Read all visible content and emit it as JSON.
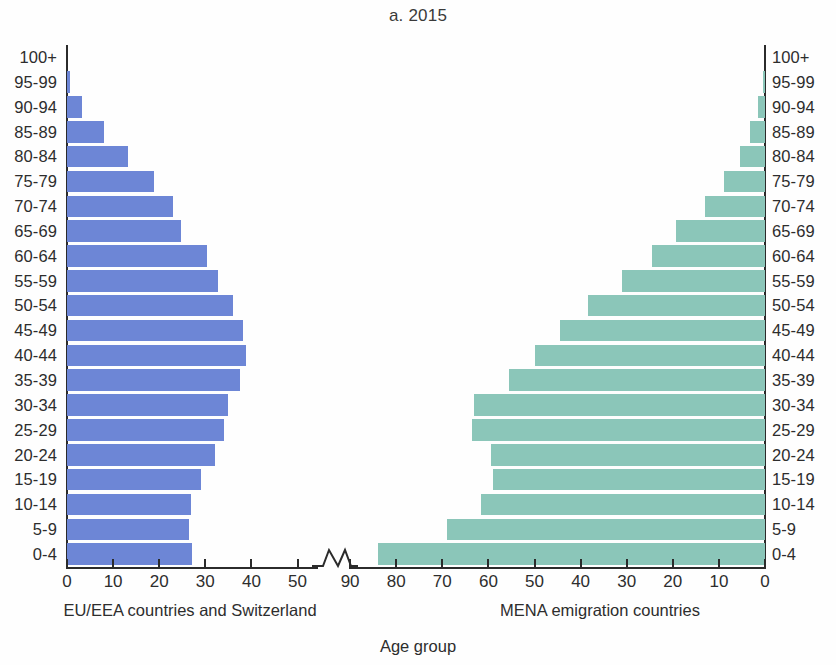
{
  "chart_data": {
    "type": "bar",
    "subtype": "population-pyramid",
    "title": "a. 2015",
    "xlabel": "Age group",
    "ylabel": "",
    "grid": false,
    "legend_position": "none",
    "categories": [
      "100+",
      "95-99",
      "90-94",
      "85-89",
      "80-84",
      "75-79",
      "70-74",
      "65-69",
      "60-64",
      "55-59",
      "50-54",
      "45-49",
      "40-44",
      "35-39",
      "30-34",
      "25-29",
      "20-24",
      "15-19",
      "10-14",
      "5-9",
      "0-4"
    ],
    "series": [
      {
        "name": "EU/EEA countries and Switzerland",
        "side": "left",
        "color": "#6d86d6",
        "axis_ticks": [
          0,
          10,
          20,
          30,
          40,
          50
        ],
        "axis_max": 50,
        "xlim": [
          0,
          50
        ],
        "values": [
          0,
          0.6,
          3.2,
          8.0,
          13.2,
          18.8,
          22.9,
          24.8,
          30.3,
          32.8,
          36.0,
          38.2,
          38.8,
          37.6,
          35.0,
          34.0,
          32.1,
          29.0,
          27.0,
          26.4,
          27.2
        ]
      },
      {
        "name": "MENA emigration countries",
        "side": "right",
        "color": "#8bc6b9",
        "axis_ticks": [
          90,
          80,
          70,
          60,
          50,
          40,
          30,
          20,
          10,
          0
        ],
        "axis_max": 90,
        "xlim": [
          0,
          90
        ],
        "values": [
          0,
          0.5,
          1.5,
          3.2,
          5.4,
          9.0,
          13.0,
          19.3,
          24.6,
          31.0,
          38.3,
          44.5,
          50.0,
          55.5,
          63.2,
          63.5,
          59.5,
          59.0,
          61.5,
          69.0,
          84.0
        ]
      }
    ],
    "axis_break": {
      "present": true,
      "between": [
        50,
        90
      ],
      "shape": "zigzag"
    }
  },
  "captions": {
    "left": "EU/EEA countries and Switzerland",
    "right": "MENA emigration countries",
    "axis_title": "Age group"
  }
}
